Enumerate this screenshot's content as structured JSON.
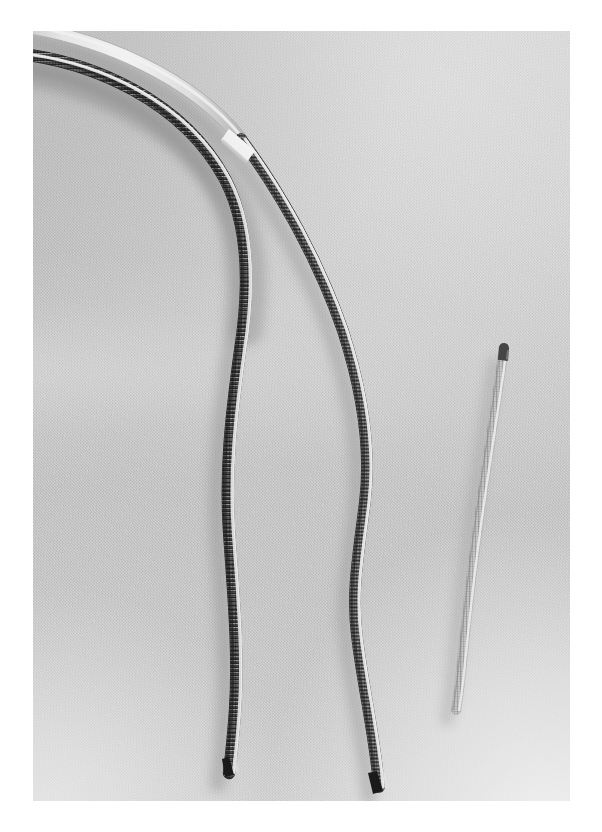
{
  "image": {
    "domain": "natural-image",
    "subject": "Three medical catheter / stent-delivery devices laid on light grey textile",
    "frame": {
      "border_color": "#ffffff",
      "plate_left": 33,
      "plate_top": 31,
      "plate_width": 537,
      "plate_height": 770
    },
    "background": {
      "type": "woven fabric",
      "base_color": "#d2d2d2",
      "highlight_color": "#e6e6e6",
      "shadow_color": "#bdbdbd",
      "near_white_corner": "#f7f7f7",
      "texture": "fine diagonal weave"
    },
    "lighting": {
      "direction": "upper-right",
      "shadow_direction": "down-left",
      "note": "soft diffuse light, gradient brightens toward bottom-right corner"
    }
  },
  "objects": [
    {
      "id": "device-1",
      "label": "Braided catheter, dark, longest",
      "position": "left",
      "description": "Enters frame at upper-left edge, arcs right and down, then runs near-vertically with slight S-curve to a cut tip near lower-left-centre",
      "surface": "tight metallic braid / coil, high-contrast cross hatching",
      "body_color": "#3c3c3c",
      "highlight_color": "#ededed",
      "tip_color": "#1e1e1e",
      "tip_shape": "blunt cut",
      "outer_diameter_px": 11,
      "enters_frame": true,
      "top_y": 0,
      "tip_y": 742
    },
    {
      "id": "device-2",
      "label": "White-jacketed catheter with braided distal shaft",
      "position": "centre",
      "description": "Shares the upper-left arc with device 1, jacketed in white polymer with a white marker collar, transitions to dark braid and descends to a dark cut tip at the bottom",
      "surface": "smooth white polymer jacket proximally, braided shaft distally",
      "jacket_color": "#f4f4f4",
      "body_color": "#4a4a4a",
      "collar_color": "#ffffff",
      "tip_color": "#232323",
      "tip_shape": "blunt cut",
      "outer_diameter_px": 10,
      "enters_frame": true,
      "top_y": 0,
      "collar_y": 112,
      "tip_y": 760
    },
    {
      "id": "device-3",
      "label": "Translucent braided sheath segment, short",
      "position": "right",
      "description": "Free-standing shorter segment with a rounded dark radiopaque tip at the top, pale translucent braided body curving gently down-left",
      "surface": "clear / translucent polymer with fine longitudinal braid filaments",
      "body_color": "#c8c8c8",
      "filament_color": "#8a8a8a",
      "tip_color": "#4d4d4d",
      "tip_shape": "rounded dome",
      "outer_diameter_px": 9,
      "enters_frame": false,
      "top_y": 316,
      "tip_y": 679
    }
  ],
  "caption": {
    "title": "",
    "alt_text": "Three slender medical catheter devices arranged on a pale grey woven background"
  }
}
